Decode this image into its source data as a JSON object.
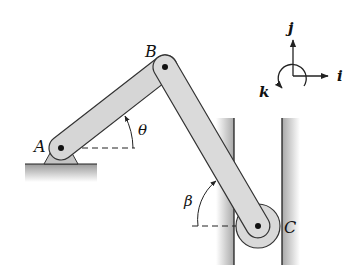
{
  "diagram": {
    "points": {
      "A": {
        "label": "A",
        "x": 61,
        "y": 148
      },
      "B": {
        "label": "B",
        "x": 165,
        "y": 67
      },
      "C": {
        "label": "C",
        "x": 258,
        "y": 226
      }
    },
    "angles": {
      "theta": {
        "label": "θ",
        "description": "angle of bar AB from horizontal at A"
      },
      "beta": {
        "label": "β",
        "description": "angle of bar BC from horizontal at C"
      }
    },
    "axes": {
      "i": "i",
      "j": "j",
      "k": "k"
    },
    "colors": {
      "bar_fill": "#d6d6d6",
      "bar_stroke": "#333333",
      "ground_fill": "#b5b5b5",
      "roller_fill": "#d9d9d9",
      "line": "#222222"
    }
  }
}
